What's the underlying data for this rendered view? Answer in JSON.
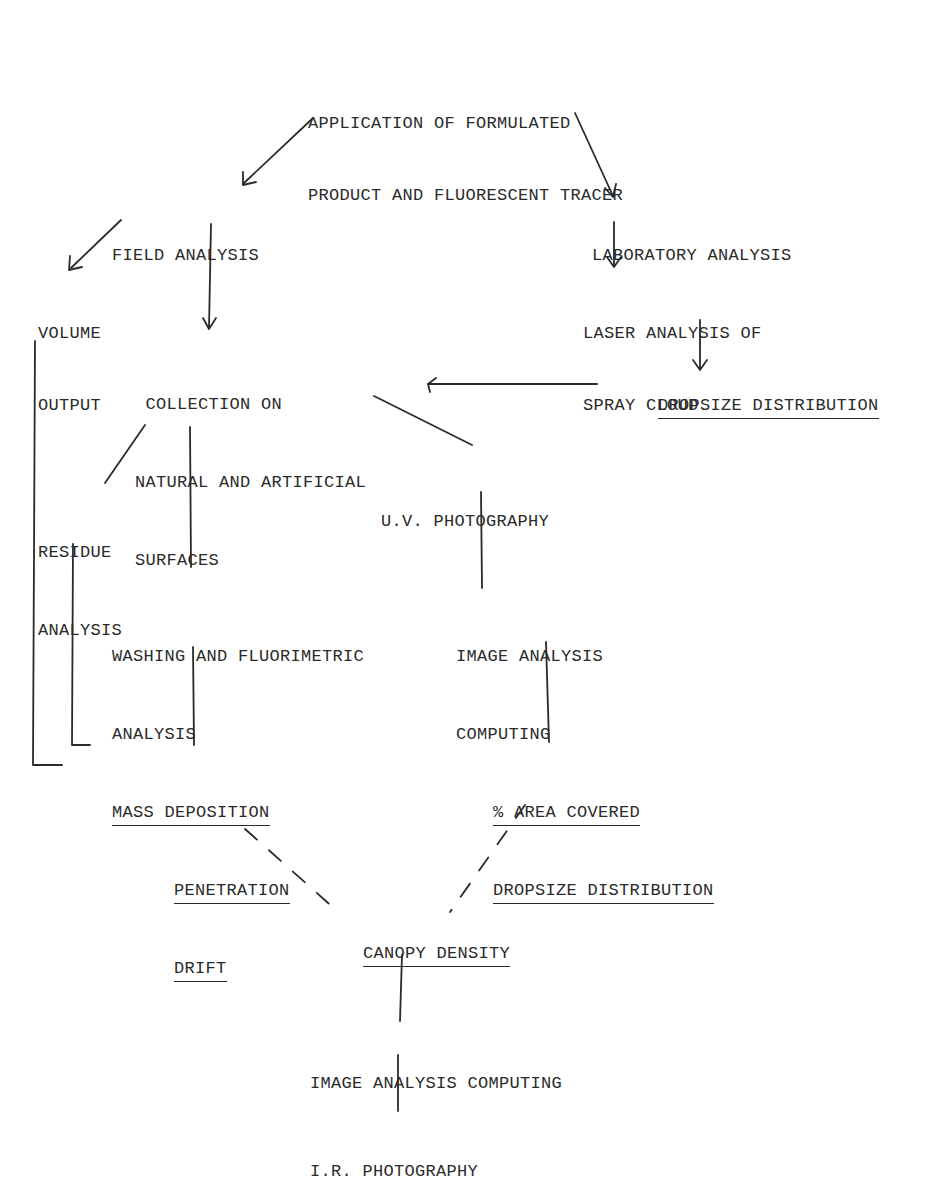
{
  "diagram": {
    "type": "flowchart",
    "nodes": {
      "application": {
        "lines": [
          "APPLICATION OF FORMULATED",
          "PRODUCT AND FLUORESCENT TRACER"
        ]
      },
      "field_analysis": {
        "lines": [
          "FIELD ANALYSIS"
        ]
      },
      "laboratory_analysis": {
        "lines": [
          "LABORATORY ANALYSIS"
        ]
      },
      "volume_output": {
        "lines": [
          "VOLUME",
          "OUTPUT"
        ]
      },
      "laser_analysis": {
        "lines": [
          "LASER ANALYSIS OF",
          "SPRAY CLOUD"
        ]
      },
      "collection": {
        "lines": [
          " COLLECTION ON",
          "NATURAL AND ARTIFICIAL",
          "SURFACES"
        ]
      },
      "dropsize_distribution_lab": {
        "lines": [
          "DROPSIZE DISTRIBUTION"
        ],
        "underlined": true
      },
      "uv_photography": {
        "lines": [
          "U.V. PHOTOGRAPHY"
        ]
      },
      "residue_analysis": {
        "lines": [
          "RESIDUE",
          "ANALYSIS"
        ]
      },
      "washing": {
        "lines": [
          "WASHING AND FLUORIMETRIC",
          "ANALYSIS"
        ]
      },
      "image_analysis_uv": {
        "lines": [
          "IMAGE ANALYSIS",
          "COMPUTING"
        ]
      },
      "mass_deposition": {
        "lines": [
          "MASS DEPOSITION",
          "PENETRATION",
          "DRIFT"
        ],
        "underlined": true
      },
      "area_covered": {
        "lines": [
          "% AREA COVERED",
          "DROPSIZE DISTRIBUTION"
        ],
        "underlined": true
      },
      "canopy_density": {
        "lines": [
          "CANOPY DENSITY"
        ],
        "underlined": true
      },
      "image_analysis_ir": {
        "lines": [
          "IMAGE ANALYSIS COMPUTING"
        ]
      },
      "ir_photography": {
        "lines": [
          "I.R. PHOTOGRAPHY"
        ]
      }
    },
    "edges": [
      {
        "from": "application",
        "to": "field_analysis",
        "style": "arrow"
      },
      {
        "from": "application",
        "to": "laboratory_analysis",
        "style": "arrow"
      },
      {
        "from": "field_analysis",
        "to": "volume_output",
        "style": "arrow"
      },
      {
        "from": "field_analysis",
        "to": "collection",
        "style": "arrow"
      },
      {
        "from": "laboratory_analysis",
        "to": "laser_analysis",
        "style": "arrow"
      },
      {
        "from": "laser_analysis",
        "to": "dropsize_distribution_lab",
        "style": "arrow"
      },
      {
        "from": "dropsize_distribution_lab",
        "to": "collection",
        "style": "arrow"
      },
      {
        "from": "collection",
        "to": "residue_analysis",
        "style": "line"
      },
      {
        "from": "collection",
        "to": "washing",
        "style": "line"
      },
      {
        "from": "collection",
        "to": "uv_photography",
        "style": "line"
      },
      {
        "from": "volume_output",
        "to": "mass_deposition",
        "style": "bracket"
      },
      {
        "from": "residue_analysis",
        "to": "mass_deposition",
        "style": "bracket"
      },
      {
        "from": "washing",
        "to": "mass_deposition",
        "style": "line"
      },
      {
        "from": "uv_photography",
        "to": "image_analysis_uv",
        "style": "line"
      },
      {
        "from": "image_analysis_uv",
        "to": "area_covered",
        "style": "line"
      },
      {
        "from": "mass_deposition",
        "to": "canopy_density",
        "style": "dashed"
      },
      {
        "from": "area_covered",
        "to": "canopy_density",
        "style": "dashed"
      },
      {
        "from": "canopy_density",
        "to": "image_analysis_ir",
        "style": "line"
      },
      {
        "from": "image_analysis_ir",
        "to": "ir_photography",
        "style": "line"
      }
    ]
  },
  "colors": {
    "ink": "#2a2a2a",
    "background": "#ffffff"
  }
}
